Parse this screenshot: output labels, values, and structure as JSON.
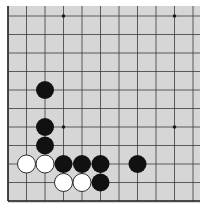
{
  "board": {
    "background": "#d6d6d6",
    "line_color": "#3a3a3a",
    "edge_color": "#1a1a1a",
    "black_color": "#111111",
    "white_color": "#ffffff",
    "origin_x": 8,
    "origin_y": 16,
    "spacing": 18.5,
    "cols": 11,
    "rows": 11,
    "left_edge": true,
    "bottom_edge": true,
    "stone_radius": 9,
    "star_points": [
      [
        3,
        0
      ],
      [
        9,
        0
      ],
      [
        3,
        6
      ],
      [
        9,
        6
      ]
    ],
    "stones": [
      {
        "color": "black",
        "col": 2,
        "row": 4
      },
      {
        "color": "black",
        "col": 2,
        "row": 6
      },
      {
        "color": "black",
        "col": 2,
        "row": 7
      },
      {
        "color": "white",
        "col": 1,
        "row": 8
      },
      {
        "color": "white",
        "col": 2,
        "row": 8
      },
      {
        "color": "black",
        "col": 3,
        "row": 8
      },
      {
        "color": "black",
        "col": 4,
        "row": 8
      },
      {
        "color": "black",
        "col": 5,
        "row": 8
      },
      {
        "color": "black",
        "col": 7,
        "row": 8
      },
      {
        "color": "white",
        "col": 3,
        "row": 9
      },
      {
        "color": "white",
        "col": 4,
        "row": 9
      },
      {
        "color": "black",
        "col": 5,
        "row": 9
      }
    ]
  }
}
